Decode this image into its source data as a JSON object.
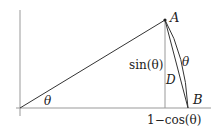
{
  "diagram": {
    "colors": {
      "background": "#ffffff",
      "axis": "#888888",
      "line": "#333333",
      "text": "#222222"
    },
    "points": {
      "origin": {
        "label": "",
        "x": 20,
        "y": 108
      },
      "A": {
        "label": "A",
        "x": 165,
        "y": 20
      },
      "B": {
        "label": "B",
        "x": 188,
        "y": 108
      },
      "foot": {
        "x": 165,
        "y": 108
      }
    },
    "labels": {
      "point_a": "A",
      "point_b": "B",
      "chord": "D",
      "arc": "θ",
      "angle": "θ",
      "height": "sin(θ)",
      "base": "1−cos(θ)"
    }
  }
}
